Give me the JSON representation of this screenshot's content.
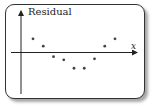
{
  "chart_data": {
    "type": "scatter",
    "title": "",
    "xlabel": "x",
    "ylabel": "Residual",
    "grid": false,
    "legend": null,
    "points": [
      {
        "x": 1,
        "y": 1.3
      },
      {
        "x": 2,
        "y": 0.6
      },
      {
        "x": 3,
        "y": -0.4
      },
      {
        "x": 4,
        "y": -0.7
      },
      {
        "x": 5,
        "y": -1.5
      },
      {
        "x": 6,
        "y": -1.5
      },
      {
        "x": 7,
        "y": -0.6
      },
      {
        "x": 8,
        "y": 0.6
      },
      {
        "x": 9,
        "y": 1.3
      }
    ]
  },
  "labels": {
    "y_axis": "Residual",
    "x_axis": "x"
  },
  "colors": {
    "axis": "#222222",
    "point": "#444444",
    "border": "#333333"
  }
}
